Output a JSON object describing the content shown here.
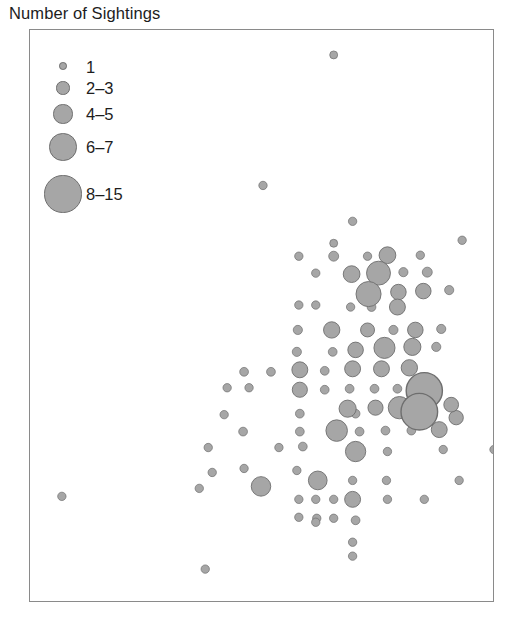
{
  "figure": {
    "width": 521,
    "height": 630,
    "background": "#ffffff",
    "frame_color": "#8a8a8a"
  },
  "legend": {
    "title": "Number of Sightings",
    "marker_fill": "#a6a6a6",
    "marker_stroke": "#6e6e6e",
    "entries": [
      {
        "label": "1",
        "radius": 3.8,
        "cx": 63,
        "cy": 66,
        "label_x": 86,
        "label_y": 58
      },
      {
        "label": "2–3",
        "radius": 6.6,
        "cx": 63,
        "cy": 88,
        "label_x": 86,
        "label_y": 79
      },
      {
        "label": "4–5",
        "radius": 9.6,
        "cx": 63,
        "cy": 114,
        "label_x": 86,
        "label_y": 105
      },
      {
        "label": "6–7",
        "radius": 13.6,
        "cx": 63,
        "cy": 147,
        "label_x": 86,
        "label_y": 138
      },
      {
        "label": "8–15",
        "radius": 18.6,
        "cx": 63,
        "cy": 194,
        "label_x": 86,
        "label_y": 185
      }
    ]
  },
  "chart_data": {
    "type": "scatter",
    "title": "Number of Sightings",
    "subtitle": "",
    "xlabel": "",
    "ylabel": "",
    "xtick_labels": [],
    "ytick_labels": [],
    "grid": false,
    "legend_position": "top-left",
    "axes_box": {
      "x": 29,
      "y": 29,
      "width": 465,
      "height": 573
    },
    "size_encoding": {
      "variable": "Number of Sightings",
      "bins": [
        {
          "label": "1",
          "min": 1,
          "max": 1,
          "radius": 3.8
        },
        {
          "label": "2–3",
          "min": 2,
          "max": 3,
          "radius": 6.6
        },
        {
          "label": "4–5",
          "min": 4,
          "max": 5,
          "radius": 9.6
        },
        {
          "label": "6–7",
          "min": 6,
          "max": 7,
          "radius": 13.6
        },
        {
          "label": "8–15",
          "min": 8,
          "max": 15,
          "radius": 18.6
        }
      ]
    },
    "marker_fill": "#a6a6a6",
    "marker_stroke": "#6e6e6e",
    "note": "Bubble map of sighting counts; x/y are pixel coordinates within the plot frame, r is the drawn bubble radius, bin is the legend class.",
    "points": [
      {
        "x": 334,
        "y": 54,
        "r": 4.0,
        "bin": "1"
      },
      {
        "x": 263,
        "y": 185,
        "r": 4.2,
        "bin": "1"
      },
      {
        "x": 353,
        "y": 221,
        "r": 4.2,
        "bin": "1"
      },
      {
        "x": 463,
        "y": 240,
        "r": 4.2,
        "bin": "1"
      },
      {
        "x": 334,
        "y": 243,
        "r": 4.0,
        "bin": "1"
      },
      {
        "x": 299,
        "y": 256,
        "r": 4.2,
        "bin": "1"
      },
      {
        "x": 334,
        "y": 256,
        "r": 5.0,
        "bin": "2–3"
      },
      {
        "x": 368,
        "y": 256,
        "r": 4.2,
        "bin": "1"
      },
      {
        "x": 388,
        "y": 255,
        "r": 8.4,
        "bin": "4–5"
      },
      {
        "x": 421,
        "y": 255,
        "r": 4.2,
        "bin": "1"
      },
      {
        "x": 316,
        "y": 273,
        "r": 4.2,
        "bin": "1"
      },
      {
        "x": 352,
        "y": 274,
        "r": 8.4,
        "bin": "4–5"
      },
      {
        "x": 379,
        "y": 273,
        "r": 12.0,
        "bin": "6–7"
      },
      {
        "x": 404,
        "y": 272,
        "r": 4.6,
        "bin": "2–3"
      },
      {
        "x": 428,
        "y": 272,
        "r": 5.0,
        "bin": "2–3"
      },
      {
        "x": 369,
        "y": 294,
        "r": 12.6,
        "bin": "6–7"
      },
      {
        "x": 399,
        "y": 292,
        "r": 7.8,
        "bin": "4–5"
      },
      {
        "x": 424,
        "y": 291,
        "r": 7.8,
        "bin": "4–5"
      },
      {
        "x": 450,
        "y": 290,
        "r": 4.6,
        "bin": "2–3"
      },
      {
        "x": 299,
        "y": 305,
        "r": 4.2,
        "bin": "1"
      },
      {
        "x": 316,
        "y": 305,
        "r": 4.2,
        "bin": "1"
      },
      {
        "x": 351,
        "y": 307,
        "r": 4.2,
        "bin": "1"
      },
      {
        "x": 372,
        "y": 307,
        "r": 4.4,
        "bin": "1"
      },
      {
        "x": 398,
        "y": 307,
        "r": 8.0,
        "bin": "4–5"
      },
      {
        "x": 298,
        "y": 330,
        "r": 4.6,
        "bin": "2–3"
      },
      {
        "x": 332,
        "y": 330,
        "r": 8.2,
        "bin": "4–5"
      },
      {
        "x": 368,
        "y": 330,
        "r": 7.0,
        "bin": "4–5"
      },
      {
        "x": 394,
        "y": 330,
        "r": 4.6,
        "bin": "2–3"
      },
      {
        "x": 416,
        "y": 330,
        "r": 7.8,
        "bin": "4–5"
      },
      {
        "x": 442,
        "y": 329,
        "r": 4.6,
        "bin": "2–3"
      },
      {
        "x": 297,
        "y": 352,
        "r": 4.6,
        "bin": "2–3"
      },
      {
        "x": 333,
        "y": 352,
        "r": 4.4,
        "bin": "1"
      },
      {
        "x": 356,
        "y": 350,
        "r": 7.8,
        "bin": "4–5"
      },
      {
        "x": 385,
        "y": 348,
        "r": 10.6,
        "bin": "6–7"
      },
      {
        "x": 413,
        "y": 347,
        "r": 8.6,
        "bin": "4–5"
      },
      {
        "x": 437,
        "y": 347,
        "r": 4.6,
        "bin": "2–3"
      },
      {
        "x": 244,
        "y": 372,
        "r": 4.4,
        "bin": "1"
      },
      {
        "x": 271,
        "y": 372,
        "r": 4.4,
        "bin": "1"
      },
      {
        "x": 300,
        "y": 370,
        "r": 8.0,
        "bin": "4–5"
      },
      {
        "x": 325,
        "y": 371,
        "r": 4.4,
        "bin": "1"
      },
      {
        "x": 353,
        "y": 369,
        "r": 8.0,
        "bin": "4–5"
      },
      {
        "x": 382,
        "y": 369,
        "r": 8.0,
        "bin": "4–5"
      },
      {
        "x": 410,
        "y": 368,
        "r": 8.2,
        "bin": "4–5"
      },
      {
        "x": 227,
        "y": 388,
        "r": 4.2,
        "bin": "1"
      },
      {
        "x": 249,
        "y": 388,
        "r": 4.2,
        "bin": "1"
      },
      {
        "x": 300,
        "y": 390,
        "r": 7.6,
        "bin": "4–5"
      },
      {
        "x": 325,
        "y": 390,
        "r": 4.4,
        "bin": "1"
      },
      {
        "x": 350,
        "y": 389,
        "r": 4.4,
        "bin": "1"
      },
      {
        "x": 375,
        "y": 389,
        "r": 4.4,
        "bin": "1"
      },
      {
        "x": 398,
        "y": 389,
        "r": 4.4,
        "bin": "1"
      },
      {
        "x": 425,
        "y": 391,
        "r": 18.2,
        "bin": "8–15"
      },
      {
        "x": 348,
        "y": 409,
        "r": 8.6,
        "bin": "4–5"
      },
      {
        "x": 376,
        "y": 408,
        "r": 7.6,
        "bin": "4–5"
      },
      {
        "x": 400,
        "y": 408,
        "r": 11.2,
        "bin": "6–7"
      },
      {
        "x": 452,
        "y": 405,
        "r": 7.4,
        "bin": "4–5"
      },
      {
        "x": 224,
        "y": 415,
        "r": 4.2,
        "bin": "1"
      },
      {
        "x": 300,
        "y": 414,
        "r": 4.4,
        "bin": "1"
      },
      {
        "x": 356,
        "y": 414,
        "r": 4.4,
        "bin": "1"
      },
      {
        "x": 420,
        "y": 412,
        "r": 18.4,
        "bin": "8–15"
      },
      {
        "x": 457,
        "y": 418,
        "r": 7.2,
        "bin": "4–5"
      },
      {
        "x": 243,
        "y": 432,
        "r": 4.4,
        "bin": "1"
      },
      {
        "x": 300,
        "y": 432,
        "r": 4.4,
        "bin": "1"
      },
      {
        "x": 337,
        "y": 431,
        "r": 10.8,
        "bin": "6–7"
      },
      {
        "x": 360,
        "y": 432,
        "r": 4.4,
        "bin": "1"
      },
      {
        "x": 386,
        "y": 431,
        "r": 4.4,
        "bin": "1"
      },
      {
        "x": 412,
        "y": 431,
        "r": 4.4,
        "bin": "1"
      },
      {
        "x": 440,
        "y": 430,
        "r": 8.0,
        "bin": "4–5"
      },
      {
        "x": 208,
        "y": 448,
        "r": 4.2,
        "bin": "1"
      },
      {
        "x": 279,
        "y": 448,
        "r": 4.2,
        "bin": "1"
      },
      {
        "x": 303,
        "y": 447,
        "r": 4.4,
        "bin": "1"
      },
      {
        "x": 356,
        "y": 452,
        "r": 10.2,
        "bin": "6–7"
      },
      {
        "x": 388,
        "y": 452,
        "r": 4.2,
        "bin": "1"
      },
      {
        "x": 444,
        "y": 450,
        "r": 4.2,
        "bin": "1"
      },
      {
        "x": 495,
        "y": 450,
        "r": 4.2,
        "bin": "1"
      },
      {
        "x": 212,
        "y": 473,
        "r": 4.2,
        "bin": "1"
      },
      {
        "x": 244,
        "y": 469,
        "r": 4.2,
        "bin": "1"
      },
      {
        "x": 297,
        "y": 471,
        "r": 4.2,
        "bin": "1"
      },
      {
        "x": 318,
        "y": 481,
        "r": 9.4,
        "bin": "4–5"
      },
      {
        "x": 353,
        "y": 481,
        "r": 4.2,
        "bin": "1"
      },
      {
        "x": 387,
        "y": 481,
        "r": 4.2,
        "bin": "1"
      },
      {
        "x": 460,
        "y": 481,
        "r": 4.2,
        "bin": "1"
      },
      {
        "x": 261,
        "y": 487,
        "r": 9.8,
        "bin": "4–5"
      },
      {
        "x": 61,
        "y": 497,
        "r": 4.2,
        "bin": "1"
      },
      {
        "x": 199,
        "y": 489,
        "r": 4.2,
        "bin": "1"
      },
      {
        "x": 299,
        "y": 500,
        "r": 4.2,
        "bin": "1"
      },
      {
        "x": 316,
        "y": 500,
        "r": 4.2,
        "bin": "1"
      },
      {
        "x": 334,
        "y": 500,
        "r": 4.2,
        "bin": "1"
      },
      {
        "x": 353,
        "y": 500,
        "r": 8.0,
        "bin": "4–5"
      },
      {
        "x": 388,
        "y": 500,
        "r": 4.2,
        "bin": "1"
      },
      {
        "x": 425,
        "y": 500,
        "r": 4.2,
        "bin": "1"
      },
      {
        "x": 299,
        "y": 518,
        "r": 4.2,
        "bin": "1"
      },
      {
        "x": 317,
        "y": 519,
        "r": 4.2,
        "bin": "1"
      },
      {
        "x": 316,
        "y": 523,
        "r": 4.2,
        "bin": "1"
      },
      {
        "x": 334,
        "y": 519,
        "r": 4.2,
        "bin": "1"
      },
      {
        "x": 356,
        "y": 521,
        "r": 4.4,
        "bin": "1"
      },
      {
        "x": 353,
        "y": 543,
        "r": 4.2,
        "bin": "1"
      },
      {
        "x": 353,
        "y": 557,
        "r": 4.2,
        "bin": "1"
      },
      {
        "x": 205,
        "y": 570,
        "r": 4.2,
        "bin": "1"
      }
    ]
  }
}
